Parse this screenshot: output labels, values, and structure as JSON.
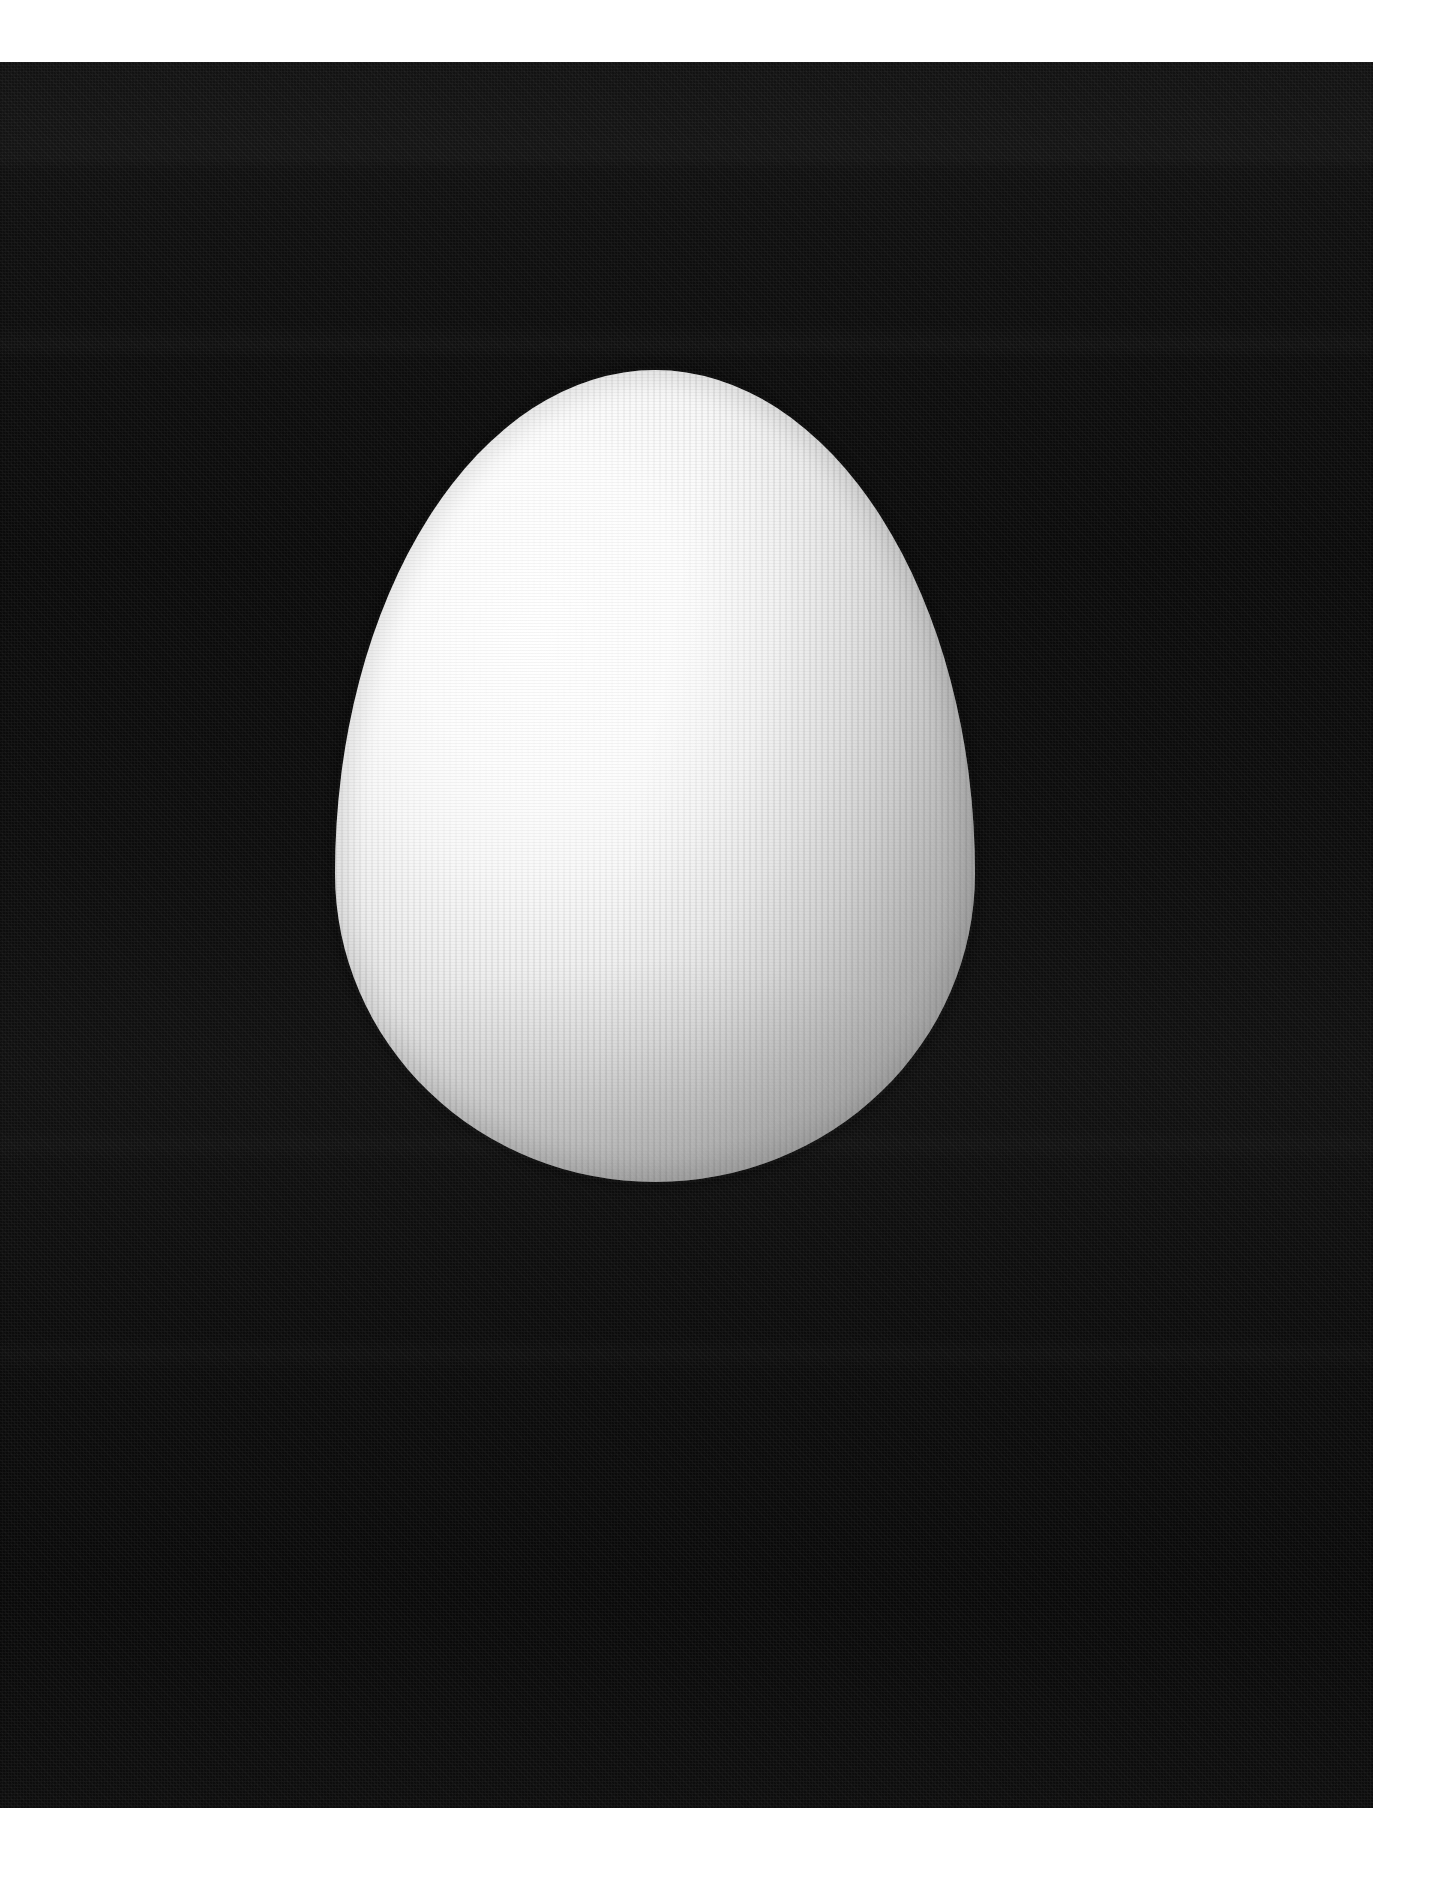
{
  "document": {
    "kind": "photographic-print",
    "canvas": {
      "width": 1429,
      "height": 1886
    },
    "paper_color": "#ffffff"
  },
  "photo": {
    "name": "egg-on-black-photograph",
    "bounds": {
      "left": 0,
      "top": 62,
      "width": 1373,
      "height": 1746
    },
    "background_color": "#0b0b0b",
    "background_description": "near-black, lightly textured photographic ground",
    "grain": "fine print screen / film grain",
    "banding": "faint horizontal scan bands"
  },
  "subject": {
    "name": "egg",
    "description": "single white chicken egg, narrow end up, lit from the upper left",
    "bounds": {
      "left": 335,
      "top": 370,
      "width": 640,
      "height": 812
    },
    "highlight_color": "#ffffff",
    "midtone_color": "#e8e8e8",
    "shadow_color": "#c3c3c3",
    "surface_texture": "fine vertical ridge striations (halftone screen)",
    "light_direction": "upper-left",
    "shadow_side": "right"
  },
  "margins": {
    "top_label": "top-paper-margin",
    "right_label": "right-paper-margin",
    "bottom_label": "bottom-paper-margin"
  }
}
